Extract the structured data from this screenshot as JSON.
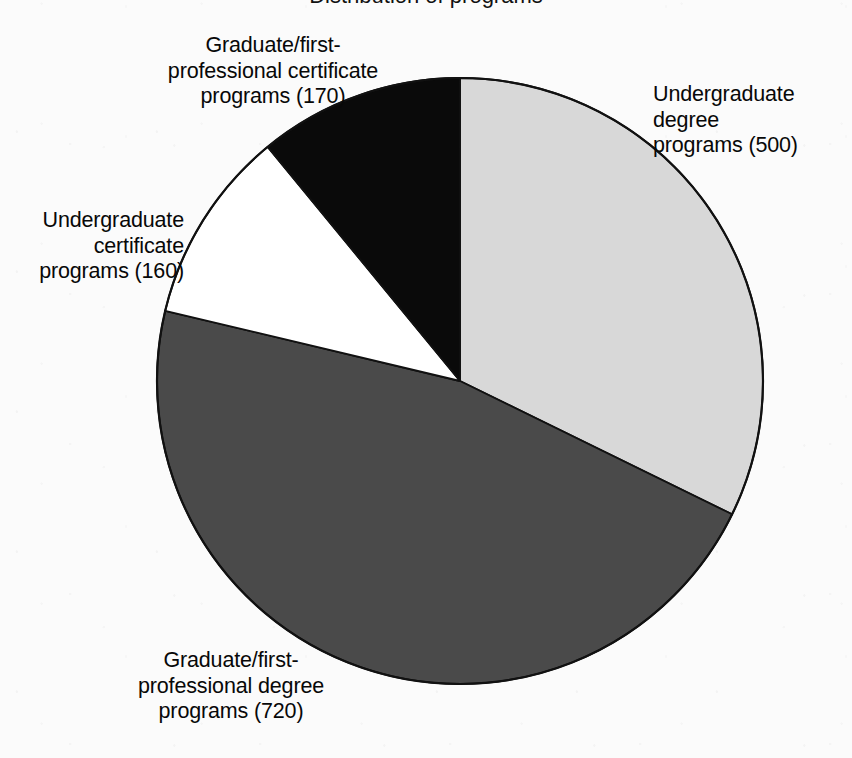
{
  "figure": {
    "title_remnant": "Distribution of programs",
    "background_color": "#fbfbfb",
    "text_color": "#080808"
  },
  "chart_data": {
    "type": "pie",
    "title": "",
    "xlabel": "",
    "ylabel": "",
    "total": 1550,
    "units": "programs",
    "start_angle_deg": 0,
    "direction": "clockwise",
    "legend": "none (direct labels)",
    "grid": false,
    "categories": [
      "Undergraduate degree programs",
      "Graduate/first-professional degree programs",
      "Undergraduate certificate programs",
      "Graduate/first-professional certificate programs"
    ],
    "values": [
      500,
      720,
      160,
      170
    ],
    "colors": [
      "#d8d8d8",
      "#4a4a4a",
      "#ffffff",
      "#0a0a0a"
    ],
    "slices": [
      {
        "name": "undergraduate-degree",
        "label": "Undergraduate\ndegree\nprograms (500)",
        "label_text": "Undergraduate degree programs (500)",
        "value": 500,
        "percent": 32.3,
        "color": "#d8d8d8",
        "start_deg": 0,
        "end_deg": 116.1,
        "label_position": "right"
      },
      {
        "name": "graduate-first-professional-degree",
        "label": "Graduate/first-\nprofessional degree\nprograms (720)",
        "label_text": "Graduate/first-professional degree programs (720)",
        "value": 720,
        "percent": 46.5,
        "color": "#4a4a4a",
        "start_deg": 116.1,
        "end_deg": 283.4,
        "label_position": "bottom"
      },
      {
        "name": "undergraduate-certificate",
        "label": "Undergraduate\ncertificate\nprograms (160)",
        "label_text": "Undergraduate certificate programs (160)",
        "value": 160,
        "percent": 10.3,
        "color": "#ffffff",
        "start_deg": 283.4,
        "end_deg": 320.6,
        "label_position": "left"
      },
      {
        "name": "graduate-first-professional-certificate",
        "label": "Graduate/first-\nprofessional certificate\nprograms (170)",
        "label_text": "Graduate/first-professional certificate programs (170)",
        "value": 170,
        "percent": 11.0,
        "color": "#0a0a0a",
        "start_deg": 320.6,
        "end_deg": 360,
        "label_position": "top-left"
      }
    ]
  },
  "geometry": {
    "center_x": 460,
    "center_y": 381,
    "radius": 303
  }
}
